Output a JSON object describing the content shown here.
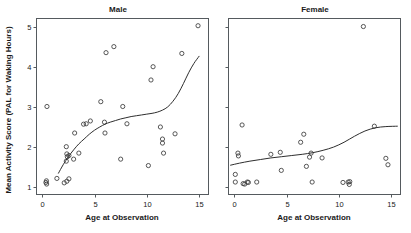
{
  "figure": {
    "axis_x_title": "Age at Observation",
    "axis_y_title": "Mean Activity Score (PAL for Waking Hours)"
  },
  "chart_data": [
    {
      "type": "scatter",
      "title": "Male",
      "xlabel": "Age at Observation",
      "ylabel": "Mean Activity Score (PAL for Waking Hours)",
      "xlim": [
        -0.55,
        15.9
      ],
      "ylim": [
        0.82,
        5.2
      ],
      "xticks": [
        0,
        5,
        10,
        15
      ],
      "yticks": [
        1,
        2,
        3,
        4,
        5
      ],
      "grid": false,
      "legend": "none",
      "points": [
        [
          0.45,
          3.01
        ],
        [
          0.35,
          1.12
        ],
        [
          0.4,
          1.16
        ],
        [
          0.42,
          1.08
        ],
        [
          1.4,
          1.22
        ],
        [
          2.1,
          1.11
        ],
        [
          2.35,
          1.15
        ],
        [
          2.55,
          1.21
        ],
        [
          2.3,
          2.01
        ],
        [
          2.35,
          1.83
        ],
        [
          2.4,
          1.76
        ],
        [
          2.3,
          1.65
        ],
        [
          2.55,
          1.79
        ],
        [
          3.0,
          1.7
        ],
        [
          3.1,
          2.35
        ],
        [
          3.5,
          1.85
        ],
        [
          3.95,
          2.57
        ],
        [
          4.2,
          2.58
        ],
        [
          4.6,
          2.65
        ],
        [
          5.6,
          3.13
        ],
        [
          5.95,
          2.62
        ],
        [
          6.1,
          4.35
        ],
        [
          6.0,
          2.35
        ],
        [
          6.85,
          4.5
        ],
        [
          7.7,
          3.01
        ],
        [
          7.5,
          1.7
        ],
        [
          8.1,
          2.58
        ],
        [
          10.15,
          1.54
        ],
        [
          10.4,
          3.67
        ],
        [
          10.6,
          4.0
        ],
        [
          11.3,
          2.5
        ],
        [
          11.5,
          2.2
        ],
        [
          11.5,
          2.1
        ],
        [
          11.6,
          1.85
        ],
        [
          12.7,
          2.33
        ],
        [
          13.35,
          4.33
        ],
        [
          14.9,
          5.02
        ]
      ],
      "fit_line": {
        "description": "smoothed trend curve",
        "points": [
          [
            1.55,
            1.35
          ],
          [
            2.0,
            1.56
          ],
          [
            2.5,
            1.76
          ],
          [
            3.0,
            1.93
          ],
          [
            3.5,
            2.08
          ],
          [
            4.0,
            2.2
          ],
          [
            4.5,
            2.32
          ],
          [
            5.0,
            2.42
          ],
          [
            5.5,
            2.5
          ],
          [
            6.0,
            2.57
          ],
          [
            6.5,
            2.62
          ],
          [
            7.0,
            2.66
          ],
          [
            7.5,
            2.7
          ],
          [
            8.0,
            2.73
          ],
          [
            8.5,
            2.76
          ],
          [
            9.0,
            2.78
          ],
          [
            9.5,
            2.8
          ],
          [
            10.0,
            2.82
          ],
          [
            10.5,
            2.84
          ],
          [
            11.0,
            2.87
          ],
          [
            11.5,
            2.92
          ],
          [
            12.0,
            3.0
          ],
          [
            12.5,
            3.14
          ],
          [
            13.0,
            3.33
          ],
          [
            13.5,
            3.58
          ],
          [
            14.0,
            3.85
          ],
          [
            14.5,
            4.08
          ],
          [
            15.0,
            4.26
          ]
        ]
      }
    },
    {
      "type": "scatter",
      "title": "Female",
      "xlabel": "Age at Observation",
      "ylabel": "Mean Activity Score (PAL for Waking Hours)",
      "xlim": [
        -0.55,
        15.9
      ],
      "ylim": [
        0.82,
        5.2
      ],
      "xticks": [
        0,
        5,
        10,
        15
      ],
      "yticks": [
        1,
        2,
        3,
        4,
        5
      ],
      "grid": false,
      "legend": "none",
      "points": [
        [
          0.1,
          1.32
        ],
        [
          0.1,
          1.13
        ],
        [
          0.35,
          1.85
        ],
        [
          0.4,
          1.78
        ],
        [
          0.75,
          2.55
        ],
        [
          0.85,
          1.09
        ],
        [
          1.0,
          1.08
        ],
        [
          1.25,
          1.13
        ],
        [
          1.35,
          1.12
        ],
        [
          2.15,
          1.13
        ],
        [
          3.5,
          1.82
        ],
        [
          4.4,
          1.87
        ],
        [
          4.5,
          1.42
        ],
        [
          6.35,
          2.12
        ],
        [
          6.65,
          2.32
        ],
        [
          6.9,
          1.52
        ],
        [
          7.2,
          1.75
        ],
        [
          7.35,
          1.85
        ],
        [
          7.45,
          1.13
        ],
        [
          8.4,
          1.73
        ],
        [
          10.4,
          1.12
        ],
        [
          10.9,
          1.13
        ],
        [
          11.0,
          1.07
        ],
        [
          11.05,
          1.14
        ],
        [
          12.35,
          5.0
        ],
        [
          13.4,
          2.52
        ],
        [
          14.5,
          1.72
        ],
        [
          14.7,
          1.56
        ]
      ],
      "fit_line": {
        "description": "smoothed trend curve",
        "points": [
          [
            -0.35,
            1.55
          ],
          [
            0.5,
            1.6
          ],
          [
            1.5,
            1.65
          ],
          [
            2.5,
            1.69
          ],
          [
            3.5,
            1.73
          ],
          [
            4.5,
            1.76
          ],
          [
            5.5,
            1.79
          ],
          [
            6.5,
            1.82
          ],
          [
            7.5,
            1.86
          ],
          [
            8.5,
            1.92
          ],
          [
            9.5,
            2.0
          ],
          [
            10.5,
            2.12
          ],
          [
            11.5,
            2.27
          ],
          [
            12.5,
            2.4
          ],
          [
            13.5,
            2.48
          ],
          [
            14.5,
            2.51
          ],
          [
            15.6,
            2.52
          ]
        ]
      }
    }
  ]
}
